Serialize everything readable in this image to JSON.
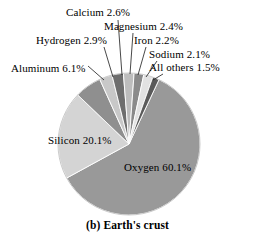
{
  "caption": "(b) Earth's crust",
  "chart_data": {
    "type": "pie",
    "title": "(b) Earth's crust",
    "subtitle": "",
    "xlabel": "",
    "ylabel": "",
    "units": "percent",
    "grid": false,
    "legend_position": "none",
    "label_style": "callout-leader-lines",
    "start_angle_deg": 25,
    "direction": "clockwise",
    "total": 100.0,
    "categories": [
      "Oxygen",
      "Silicon",
      "Aluminum",
      "Hydrogen",
      "Calcium",
      "Magnesium",
      "Iron",
      "Sodium",
      "All others"
    ],
    "values": [
      60.1,
      20.1,
      6.1,
      2.9,
      2.6,
      2.4,
      2.2,
      2.1,
      1.5
    ],
    "slices": [
      {
        "name": "Oxygen",
        "label": "Oxygen 60.1%",
        "value": 60.1,
        "color": "#999999",
        "label_placement": "inside"
      },
      {
        "name": "Silicon",
        "label": "Silicon 20.1%",
        "value": 20.1,
        "color": "#d4d4d4",
        "label_placement": "inside"
      },
      {
        "name": "Aluminum",
        "label": "Aluminum 6.1%",
        "value": 6.1,
        "color": "#8f8f8f",
        "label_placement": "callout"
      },
      {
        "name": "Hydrogen",
        "label": "Hydrogen 2.9%",
        "value": 2.9,
        "color": "#c8c8c8",
        "label_placement": "callout"
      },
      {
        "name": "Calcium",
        "label": "Calcium 2.6%",
        "value": 2.6,
        "color": "#6e6e6e",
        "label_placement": "callout"
      },
      {
        "name": "Magnesium",
        "label": "Magnesium 2.4%",
        "value": 2.4,
        "color": "#bdbdbd",
        "label_placement": "callout"
      },
      {
        "name": "Iron",
        "label": "Iron 2.2%",
        "value": 2.2,
        "color": "#8a8a8a",
        "label_placement": "callout"
      },
      {
        "name": "Sodium",
        "label": "Sodium 2.1%",
        "value": 2.1,
        "color": "#e2e2e2",
        "label_placement": "callout"
      },
      {
        "name": "All others",
        "label": "All others 1.5%",
        "value": 1.5,
        "color": "#5a5a5a",
        "label_placement": "callout"
      }
    ]
  }
}
